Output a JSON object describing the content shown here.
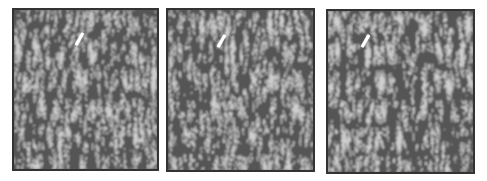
{
  "figure": {
    "panels": [
      {
        "id": "a",
        "x": 12,
        "y": 8,
        "w": 147,
        "h": 163,
        "seed": 3,
        "arrow": {
          "x": 64,
          "y": 22
        }
      },
      {
        "id": "b",
        "x": 166,
        "y": 8,
        "w": 149,
        "h": 164,
        "seed": 7,
        "arrow": {
          "x": 52,
          "y": 24
        }
      },
      {
        "id": "c",
        "x": 326,
        "y": 9,
        "w": 149,
        "h": 165,
        "seed": 11,
        "arrow": {
          "x": 36,
          "y": 23
        }
      }
    ],
    "colors": {
      "border": "#333333",
      "stripe_dark": "#555555",
      "stripe_light": "#cfcfcf",
      "arrow": "#ffffff",
      "background": "#ffffff"
    },
    "pattern": "labyrinthine stripe domains",
    "marker_icon": "arrow-marker"
  }
}
